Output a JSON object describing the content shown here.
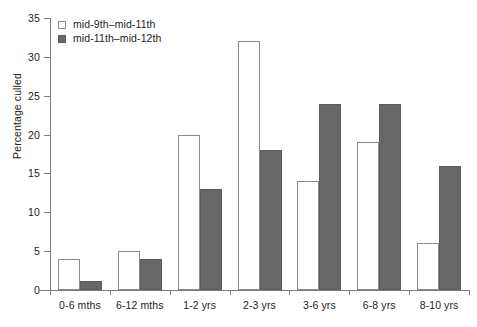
{
  "chart_data": {
    "type": "bar",
    "title": "",
    "subtitle": "",
    "xlabel": "",
    "ylabel": "Percentage culled",
    "ylim": [
      0,
      35
    ],
    "ytick_values": [
      0,
      5,
      10,
      15,
      20,
      25,
      30,
      35
    ],
    "ytick_labels": [
      "0",
      "5",
      "10",
      "15",
      "20",
      "25",
      "30",
      "35"
    ],
    "grid": false,
    "legend_position": "top-left",
    "categories": [
      "0-6 mths",
      "6-12 mths",
      "1-2 yrs",
      "2-3 yrs",
      "3-6 yrs",
      "6-8 yrs",
      "8-10 yrs"
    ],
    "series": [
      {
        "name": "mid-9th–mid-11th",
        "color": "#ffffff",
        "edge_color": "#8a8a8a",
        "values": [
          4,
          5,
          20,
          32,
          14,
          19,
          6
        ]
      },
      {
        "name": "mid-11th–mid-12th",
        "color": "#676767",
        "edge_color": "#5c5c5c",
        "values": [
          1.2,
          4,
          13,
          18,
          24,
          24,
          16
        ]
      }
    ],
    "annotations": []
  },
  "axes": {
    "y_axis_name": "y-axis",
    "x_axis_name": "x-axis"
  }
}
